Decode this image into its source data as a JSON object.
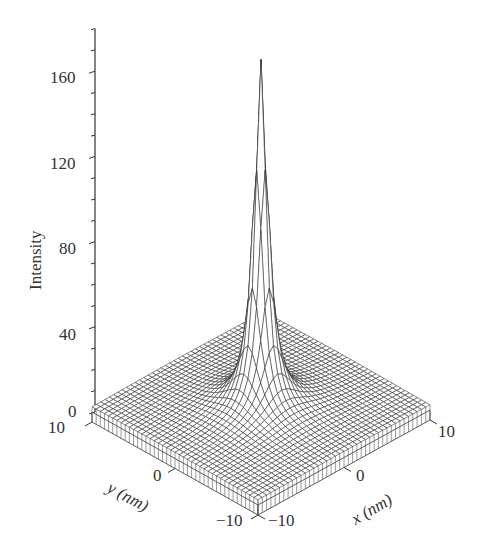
{
  "chart_data": {
    "type": "surface",
    "title": "",
    "zlabel": "Intensity",
    "xlabel": "x (nm)",
    "ylabel": "y (nm)",
    "z_ticks": [
      0,
      40,
      80,
      120,
      160
    ],
    "z_minor_step": 10,
    "zlim": [
      0,
      180
    ],
    "x_ticks": [
      -10,
      0,
      10
    ],
    "y_ticks": [
      -10,
      0,
      10
    ],
    "xlim": [
      -10,
      10
    ],
    "ylim": [
      -10,
      10
    ],
    "grid_lines_per_axis": 41,
    "surface": {
      "description": "Sharply peaked, radially symmetric intensity centered at (0,0)",
      "peak_value": 165,
      "peak_location": [
        0,
        0
      ],
      "baseline": 2,
      "approx_profile": [
        {
          "r_nm": 0,
          "intensity": 165
        },
        {
          "r_nm": 0.5,
          "intensity": 120
        },
        {
          "r_nm": 1,
          "intensity": 75
        },
        {
          "r_nm": 2,
          "intensity": 35
        },
        {
          "r_nm": 4,
          "intensity": 12
        },
        {
          "r_nm": 7,
          "intensity": 4
        },
        {
          "r_nm": 10,
          "intensity": 2
        }
      ]
    }
  },
  "labels": {
    "z_axis_title": "Intensity",
    "x_axis_title": "x (nm)",
    "y_axis_title": "y (nm)",
    "z_tick_0": "0",
    "z_tick_40": "40",
    "z_tick_80": "80",
    "z_tick_120": "120",
    "z_tick_160": "160",
    "y_tick_10": "10",
    "y_tick_0": "0",
    "y_tick_neg10": "−10",
    "x_tick_neg10": "−10",
    "x_tick_0": "0",
    "x_tick_10": "10"
  }
}
